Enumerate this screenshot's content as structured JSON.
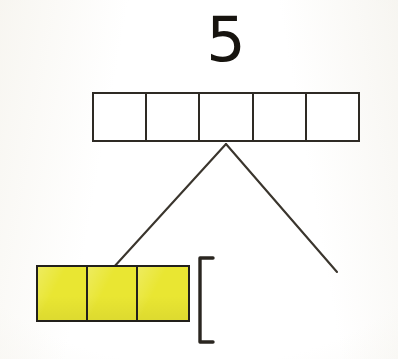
{
  "page": {
    "background_color": "#fdfdfb"
  },
  "total": {
    "label": "5",
    "name": "total-number"
  },
  "bar_model": {
    "name": "five-cell-bar",
    "cell_count": 5,
    "filled_count": 0,
    "cells": [
      {
        "index": 1,
        "fill": "empty",
        "label": ""
      },
      {
        "index": 2,
        "fill": "empty",
        "label": ""
      },
      {
        "index": 3,
        "fill": "empty",
        "label": ""
      },
      {
        "index": 4,
        "fill": "empty",
        "label": ""
      },
      {
        "index": 5,
        "fill": "empty",
        "label": ""
      }
    ],
    "border_color": "#2e2a24",
    "fill_color": "#ffffff"
  },
  "branches": {
    "name": "number-bond-branches",
    "apex": {
      "x": 226,
      "y": 144
    },
    "left_end": {
      "x": 113,
      "y": 268
    },
    "right_end": {
      "x": 337,
      "y": 272
    },
    "stroke_color": "#3a352d"
  },
  "cube_group": {
    "name": "yellow-unit-cubes",
    "count": 3,
    "color": "#e9e632",
    "border_color": "#22201b",
    "cubes": [
      {
        "index": 1,
        "color": "#e9e632"
      },
      {
        "index": 2,
        "color": "#e9e632"
      },
      {
        "index": 3,
        "color": "#e9e632"
      }
    ]
  },
  "bracket": {
    "name": "grouping-bracket",
    "glyph": "[",
    "stroke_color": "#2a2620",
    "label": ""
  },
  "empty_slot": {
    "name": "right-branch-answer-slot",
    "label": ""
  }
}
